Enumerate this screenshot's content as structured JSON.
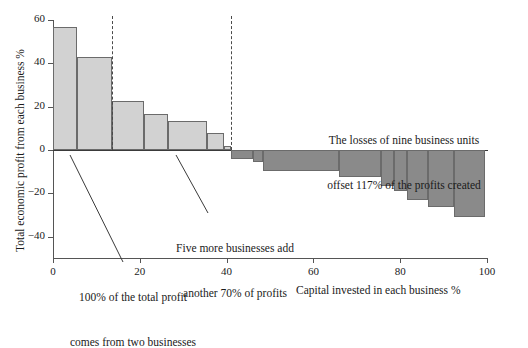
{
  "chart_data": {
    "type": "bar",
    "title": "",
    "subtitle": "",
    "xlabel": "Capital invested in each business %",
    "ylabel": "Total economic profit from each business %",
    "xlim": [
      0,
      100
    ],
    "ylim": [
      -50,
      60
    ],
    "xticks": [
      0,
      20,
      40,
      60,
      80,
      100
    ],
    "xtick_labels": [
      "0",
      "20",
      "40",
      "60",
      "80",
      "100"
    ],
    "yticks": [
      60,
      40,
      20,
      0,
      -20,
      -40
    ],
    "ytick_labels": [
      "60",
      "40",
      "20",
      "0",
      "−20",
      "−40"
    ],
    "grid": false,
    "legend": "none",
    "note": "Profit-pool / waterfall chart. Each bar spans the share of capital invested (x-width) at the economic profit rate (y-height) for one business unit.",
    "bars": [
      {
        "index": 1,
        "x_start": 0.0,
        "x_end": 5.5,
        "value": 57.0,
        "sign": "positive"
      },
      {
        "index": 2,
        "x_start": 5.5,
        "x_end": 13.5,
        "value": 43.0,
        "sign": "positive"
      },
      {
        "index": 3,
        "x_start": 13.5,
        "x_end": 21.0,
        "value": 22.5,
        "sign": "positive"
      },
      {
        "index": 4,
        "x_start": 21.0,
        "x_end": 26.5,
        "value": 16.5,
        "sign": "positive"
      },
      {
        "index": 5,
        "x_start": 26.5,
        "x_end": 35.5,
        "value": 13.5,
        "sign": "positive"
      },
      {
        "index": 6,
        "x_start": 35.5,
        "x_end": 39.5,
        "value": 8.0,
        "sign": "positive"
      },
      {
        "index": 7,
        "x_start": 39.5,
        "x_end": 41.0,
        "value": 2.0,
        "sign": "positive"
      },
      {
        "index": 8,
        "x_start": 41.0,
        "x_end": 46.0,
        "value": -4.0,
        "sign": "negative"
      },
      {
        "index": 9,
        "x_start": 46.0,
        "x_end": 48.5,
        "value": -5.5,
        "sign": "negative"
      },
      {
        "index": 10,
        "x_start": 48.5,
        "x_end": 66.0,
        "value": -9.5,
        "sign": "negative"
      },
      {
        "index": 11,
        "x_start": 66.0,
        "x_end": 75.5,
        "value": -12.5,
        "sign": "negative"
      },
      {
        "index": 12,
        "x_start": 75.5,
        "x_end": 78.5,
        "value": -16.5,
        "sign": "negative"
      },
      {
        "index": 13,
        "x_start": 78.5,
        "x_end": 81.5,
        "value": -19.0,
        "sign": "negative"
      },
      {
        "index": 14,
        "x_start": 81.5,
        "x_end": 86.5,
        "value": -23.0,
        "sign": "negative"
      },
      {
        "index": 15,
        "x_start": 86.5,
        "x_end": 92.5,
        "value": -26.5,
        "sign": "negative"
      },
      {
        "index": 16,
        "x_start": 92.5,
        "x_end": 99.5,
        "value": -31.0,
        "sign": "negative"
      }
    ],
    "reference_lines": [
      {
        "name": "two-businesses-divider",
        "x": 13.5,
        "style": "dashed"
      },
      {
        "name": "seven-businesses-divider",
        "x": 41.0,
        "style": "dashed"
      }
    ],
    "annotations": [
      {
        "name": "losses-note",
        "line1": "The losses of nine business units",
        "line2": "offset 117% of the profits created",
        "leader": false
      },
      {
        "name": "five-more-note",
        "line1": "Five more businesses add",
        "line2": "another 70% of profits",
        "leader": true
      },
      {
        "name": "two-businesses-note",
        "line1": "100% of the total profit",
        "line2": "comes from two businesses",
        "leader": true
      }
    ],
    "colors": {
      "positive_bar": "#d2d2d2",
      "negative_bar": "#8a8a8a",
      "bar_outline": "#6b6b6b",
      "axis": "#555555",
      "text": "#1a1a1a",
      "background": "#ffffff"
    }
  }
}
